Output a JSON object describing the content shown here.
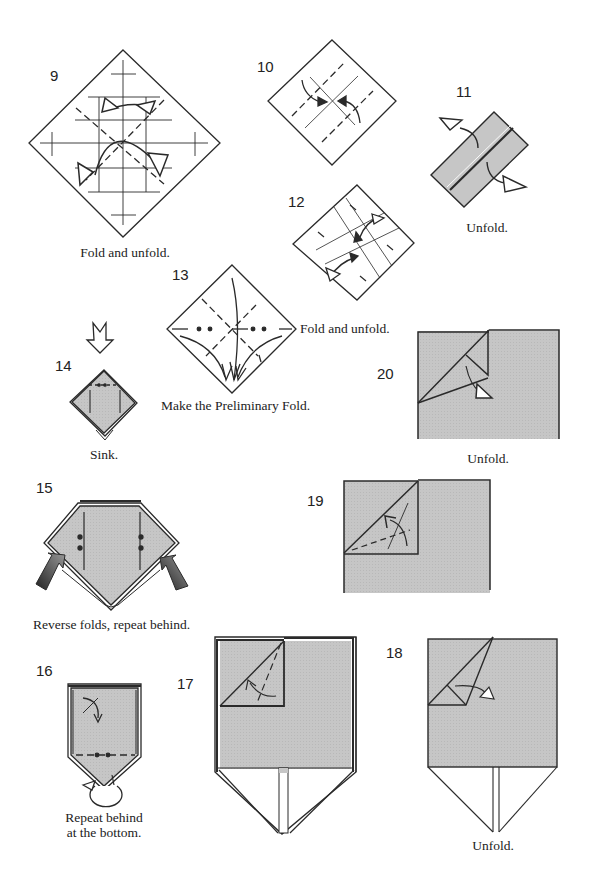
{
  "colors": {
    "paper_gray": "#c8c8c8",
    "line": "#2a2a2a",
    "background": "#ffffff"
  },
  "steps": [
    {
      "number": "9",
      "caption": "Fold and unfold."
    },
    {
      "number": "10",
      "caption": ""
    },
    {
      "number": "11",
      "caption": "Unfold."
    },
    {
      "number": "12",
      "caption": "Fold and unfold."
    },
    {
      "number": "13",
      "caption": "Make the Preliminary Fold."
    },
    {
      "number": "14",
      "caption": "Sink."
    },
    {
      "number": "15",
      "caption": "Reverse folds, repeat behind."
    },
    {
      "number": "16",
      "caption_line1": "Repeat behind",
      "caption_line2": "at the bottom."
    },
    {
      "number": "17",
      "caption": ""
    },
    {
      "number": "18",
      "caption": "Unfold."
    },
    {
      "number": "19",
      "caption": ""
    },
    {
      "number": "20",
      "caption": "Unfold."
    }
  ]
}
